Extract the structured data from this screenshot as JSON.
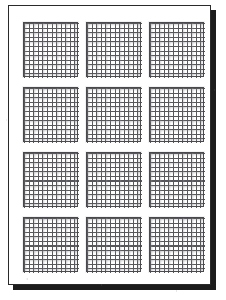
{
  "document": {
    "title": "Grid Worksheet Page",
    "media": "scanned-paper-sheet",
    "orientation": "portrait",
    "page_background_color": "#ffffff",
    "page_border_color": "#2a2a2a",
    "shadow_color": "#1c1c1c",
    "canvas_background_color": "#ffffff"
  },
  "layout": {
    "columns": 3,
    "rows": 4,
    "total_blocks": 12,
    "block_label": "grid-square"
  },
  "grid_style": {
    "cells_across": 12,
    "cells_down": 12,
    "line_color": "#58585c",
    "soft_line_color": "#96969b",
    "frame_color": "#4a4a4e",
    "cell_fill_color": "#ffffff"
  },
  "blocks": [
    {
      "id": "grid-1",
      "row": 1,
      "column": 1,
      "cells_across": 12,
      "cells_down": 12
    },
    {
      "id": "grid-2",
      "row": 1,
      "column": 2,
      "cells_across": 12,
      "cells_down": 12
    },
    {
      "id": "grid-3",
      "row": 1,
      "column": 3,
      "cells_across": 12,
      "cells_down": 12
    },
    {
      "id": "grid-4",
      "row": 2,
      "column": 1,
      "cells_across": 12,
      "cells_down": 12
    },
    {
      "id": "grid-5",
      "row": 2,
      "column": 2,
      "cells_across": 12,
      "cells_down": 12
    },
    {
      "id": "grid-6",
      "row": 2,
      "column": 3,
      "cells_across": 12,
      "cells_down": 12
    },
    {
      "id": "grid-7",
      "row": 3,
      "column": 1,
      "cells_across": 12,
      "cells_down": 12
    },
    {
      "id": "grid-8",
      "row": 3,
      "column": 2,
      "cells_across": 12,
      "cells_down": 12
    },
    {
      "id": "grid-9",
      "row": 3,
      "column": 3,
      "cells_across": 12,
      "cells_down": 12
    },
    {
      "id": "grid-10",
      "row": 4,
      "column": 1,
      "cells_across": 12,
      "cells_down": 12
    },
    {
      "id": "grid-11",
      "row": 4,
      "column": 2,
      "cells_across": 12,
      "cells_down": 12
    },
    {
      "id": "grid-12",
      "row": 4,
      "column": 3,
      "cells_across": 12,
      "cells_down": 12
    }
  ]
}
